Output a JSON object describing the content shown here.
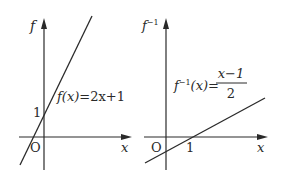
{
  "left_plot": {
    "y_axis_label": "f",
    "x_axis_label": "x",
    "origin_label": "O",
    "y_intercept_label": "1",
    "equation_lhs": "f(x)",
    "equation_eq": "=",
    "equation_rhs": "2x+1"
  },
  "right_plot": {
    "y_axis_label_base": "f",
    "y_axis_label_sup": "−1",
    "x_axis_label": "x",
    "origin_label": "O",
    "x_intercept_label": "1",
    "equation_lhs_base": "f",
    "equation_lhs_sup": "−1",
    "equation_lhs_arg": "(x)=",
    "equation_numerator": "x−1",
    "equation_denominator": "2"
  },
  "colors": {
    "ink": "#2a2a2a",
    "background": "#ffffff"
  }
}
